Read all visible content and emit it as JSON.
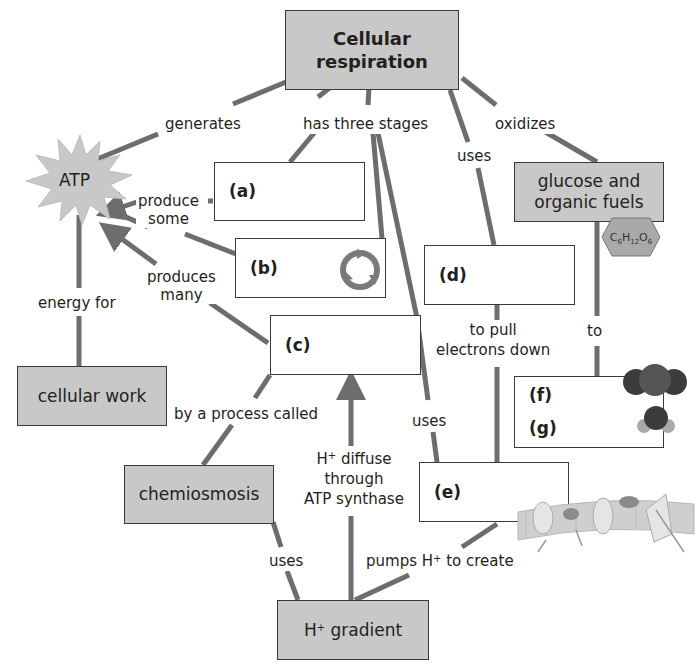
{
  "diagram": {
    "type": "concept-map",
    "colors": {
      "gray_fill": "#c8c8c8",
      "link": "#6d6d6d",
      "border": "#3a3a3a",
      "text": "#231f20"
    },
    "nodes": {
      "root": "Cellular respiration",
      "root_line1": "Cellular",
      "root_line2": "respiration",
      "atp": "ATP",
      "cellular_work": "cellular work",
      "glucose_line1": "glucose and",
      "glucose_line2": "organic fuels",
      "glucose_formula": "C6H12O6",
      "chemiosmosis": "chemiosmosis",
      "h_gradient": "H+ gradient",
      "blank_a": "(a)",
      "blank_b": "(b)",
      "blank_c": "(c)",
      "blank_d": "(d)",
      "blank_e": "(e)",
      "blank_f": "(f)",
      "blank_g": "(g)"
    },
    "links": {
      "generates": "generates",
      "has_three_stages": "has three stages",
      "uses_top": "uses",
      "oxidizes": "oxidizes",
      "produce_some_1": "produce",
      "produce_some_2": "some",
      "produces_many_1": "produces",
      "produces_many_2": "many",
      "energy_for": "energy for",
      "to_pull_1": "to pull",
      "to_pull_2": "electrons down",
      "to": "to",
      "by_a_process_called": "by a process called",
      "uses_mid": "uses",
      "h_diffuse_1": "diffuse",
      "h_diffuse_2": "through",
      "h_diffuse_3": "ATP synthase",
      "uses_bottom": "uses",
      "pumps_1": "pumps H",
      "pumps_2": "to create"
    },
    "icons": [
      "starburst-atp",
      "cycle-arrows-icon",
      "hexagon-glucose",
      "co2-molecule",
      "h2o-molecule",
      "membrane-illustration"
    ]
  }
}
